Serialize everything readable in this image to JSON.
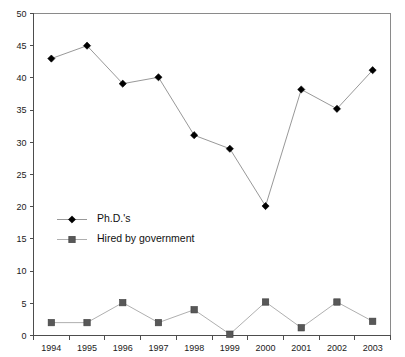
{
  "chart_data": {
    "type": "line",
    "title": "",
    "subtitle": "",
    "xlabel": "",
    "ylabel": "",
    "categories": [
      "1994",
      "1995",
      "1996",
      "1997",
      "1998",
      "1999",
      "2000",
      "2001",
      "2002",
      "2003"
    ],
    "series": [
      {
        "name": "Ph.D.'s",
        "marker": "diamond",
        "color": "#000000",
        "line_color": "#8c8c8c",
        "values": [
          43,
          45,
          39.1,
          40.1,
          31.1,
          29,
          20.1,
          38.2,
          35.2,
          41.2
        ]
      },
      {
        "name": "Hired by government",
        "marker": "square",
        "color": "#585858",
        "line_color": "#a6a6a6",
        "values": [
          2,
          2,
          5.1,
          2,
          4,
          0.2,
          5.2,
          1.2,
          5.2,
          2.2
        ]
      }
    ],
    "ylim": [
      0,
      50
    ],
    "yticks": [
      0,
      5,
      10,
      15,
      20,
      25,
      30,
      35,
      40,
      45,
      50
    ],
    "ytick_labels": [
      "0",
      "5",
      "10",
      "15",
      "20",
      "25",
      "30",
      "35",
      "40",
      "45",
      "50"
    ],
    "xtick_labels": [
      "1994",
      "1995",
      "1996",
      "1997",
      "1998",
      "1999",
      "2000",
      "2001",
      "2002",
      "2003"
    ],
    "grid": false,
    "legend_position": "inside-left",
    "legend": [
      "Ph.D.'s",
      "Hired by government"
    ]
  },
  "axes": {
    "y_axis_name": "value-axis",
    "x_axis_name": "year-axis"
  },
  "legend_items": [
    {
      "label": "Ph.D.'s",
      "marker": "diamond"
    },
    {
      "label": "Hired by government",
      "marker": "square"
    }
  ]
}
